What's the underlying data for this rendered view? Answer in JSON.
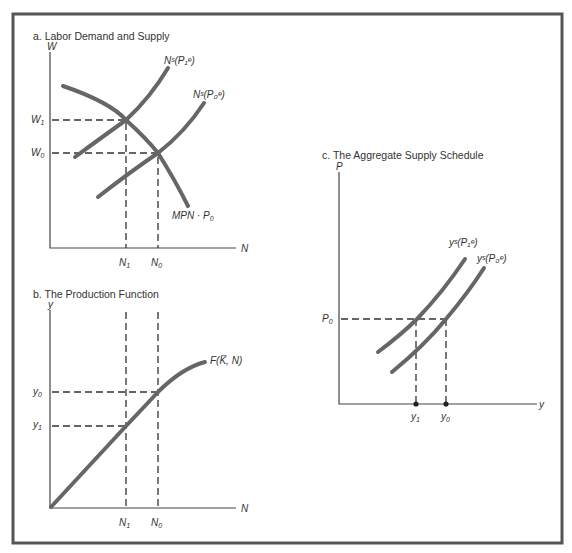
{
  "figure": {
    "panel_a": {
      "title": "a.  Labor Demand and Supply",
      "y_axis_label": "W",
      "x_axis_label": "N",
      "y_ticks": [
        {
          "label": "W",
          "sub": "1"
        },
        {
          "label": "W",
          "sub": "0"
        }
      ],
      "x_ticks": [
        {
          "label": "N",
          "sub": "1"
        },
        {
          "label": "N",
          "sub": "0"
        }
      ],
      "curves": {
        "supply_1": "Nˢ(P₁ᵉ)",
        "supply_0": "Nˢ(P₀ᵉ)",
        "demand": "MPN · P",
        "demand_sub": "0"
      }
    },
    "panel_b": {
      "title": "b.  The Production Function",
      "y_axis_label": "y",
      "x_axis_label": "N",
      "y_ticks": [
        {
          "label": "y",
          "sub": "0"
        },
        {
          "label": "y",
          "sub": "1"
        }
      ],
      "x_ticks": [
        {
          "label": "N",
          "sub": "1"
        },
        {
          "label": "N",
          "sub": "0"
        }
      ],
      "curve_label": "F(K̅, N)"
    },
    "panel_c": {
      "title": "c.  The Aggregate Supply Schedule",
      "y_axis_label": "P",
      "x_axis_label": "y",
      "y_ticks": [
        {
          "label": "P",
          "sub": "0"
        }
      ],
      "x_ticks": [
        {
          "label": "y",
          "sub": "1"
        },
        {
          "label": "y",
          "sub": "0"
        }
      ],
      "curves": {
        "supply_1": "yˢ(P₁ᵉ)",
        "supply_0": "yˢ(P₀ᵉ)"
      }
    },
    "caption_fragment": "Labor market equilibrium shifts as expected price level changes"
  },
  "colors": {
    "curve": "#666666",
    "axis": "#444444",
    "frame": "#555555",
    "background": "#ffffff"
  }
}
